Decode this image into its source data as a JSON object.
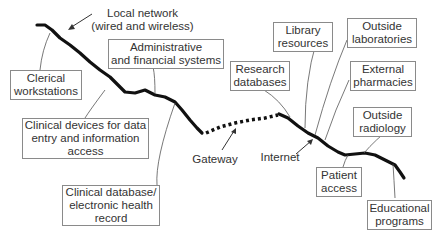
{
  "diagram": {
    "annotations": {
      "local_network": "Local network\n(wired and wireless)",
      "gateway": "Gateway",
      "internet": "Internet"
    },
    "internal_nodes": [
      {
        "id": "clerical",
        "label": "Clerical\nworkstations"
      },
      {
        "id": "admin",
        "label": "Administrative\nand financial systems"
      },
      {
        "id": "clinical_devices",
        "label": "Clinical devices for data\nentry and information\naccess"
      },
      {
        "id": "clinical_db",
        "label": "Clinical database/\nelectronic health\nrecord"
      }
    ],
    "external_nodes": [
      {
        "id": "research",
        "label": "Research\ndatabases"
      },
      {
        "id": "library",
        "label": "Library\nresources"
      },
      {
        "id": "labs",
        "label": "Outside\nlaboratories"
      },
      {
        "id": "pharmacies",
        "label": "External\npharmacies"
      },
      {
        "id": "radiology",
        "label": "Outside\nradiology"
      },
      {
        "id": "patient",
        "label": "Patient\naccess"
      },
      {
        "id": "education",
        "label": "Educational\nprograms"
      }
    ],
    "colors": {
      "line": "#111111",
      "box_border": "#8a8a8a",
      "connector": "#555555",
      "text": "#333333"
    }
  }
}
